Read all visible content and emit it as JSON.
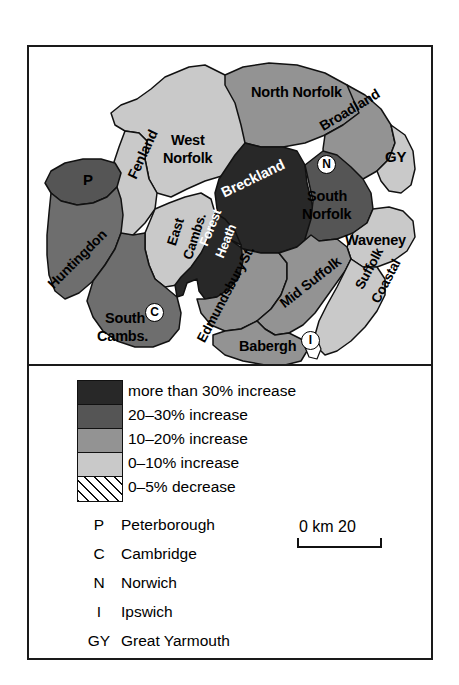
{
  "figure": {
    "type": "choropleth-map"
  },
  "map": {
    "regions": [
      {
        "id": "north-norfolk",
        "label": "North Norfolk",
        "class_index": 2
      },
      {
        "id": "broadland",
        "label": "Broadland",
        "class_index": 2
      },
      {
        "id": "great-yarmouth",
        "label": "GY",
        "class_index": 3
      },
      {
        "id": "west-norfolk",
        "label": "West\nNorfolk",
        "class_index": 3
      },
      {
        "id": "breckland",
        "label": "Breckland",
        "class_index": 0
      },
      {
        "id": "south-norfolk",
        "label": "South\nNorfolk",
        "class_index": 1
      },
      {
        "id": "waveney",
        "label": "Waveney",
        "class_index": 3
      },
      {
        "id": "fenland",
        "label": "Fenland",
        "class_index": 3
      },
      {
        "id": "peterborough",
        "label": "P",
        "class_index": 1
      },
      {
        "id": "huntingdon",
        "label": "Huntingdon",
        "class_index": 1
      },
      {
        "id": "east-cambs",
        "label": "East\nCambs.",
        "class_index": 3
      },
      {
        "id": "forest-heath",
        "label": "Forest\nHeath",
        "class_index": 0
      },
      {
        "id": "south-cambs",
        "label": "South\nCambs.",
        "class_index": 1
      },
      {
        "id": "st-edmundsbury",
        "label": "St.\nEdmundsbury",
        "class_index": 2
      },
      {
        "id": "mid-suffolk",
        "label": "Mid Suffolk",
        "class_index": 2
      },
      {
        "id": "suffolk-coastal",
        "label": "Suffolk\nCoastal",
        "class_index": 3
      },
      {
        "id": "babergh",
        "label": "Babergh",
        "class_index": 2
      }
    ],
    "city_markers": [
      {
        "id": "norwich-marker",
        "letter": "N"
      },
      {
        "id": "cambridge-marker",
        "letter": "C"
      },
      {
        "id": "ipswich-marker",
        "letter": "I"
      }
    ],
    "labels": {
      "north_norfolk": "North Norfolk",
      "broadland": "Broadland",
      "gy": "GY",
      "west_norfolk_l1": "West",
      "west_norfolk_l2": "Norfolk",
      "breckland": "Breckland",
      "south_norfolk_l1": "South",
      "south_norfolk_l2": "Norfolk",
      "waveney": "Waveney",
      "fenland": "Fenland",
      "peterborough_initial": "P",
      "huntingdon": "Huntingdon",
      "east_cambs_l1": "East",
      "east_cambs_l2": "Cambs.",
      "forest_heath_l1": "Forest",
      "forest_heath_l2": "Heath",
      "south_cambs_l1": "South",
      "south_cambs_l2": "Cambs.",
      "st_edmundsbury_l1": "St.",
      "st_edmundsbury_l2": "Edmundsbury",
      "mid_suffolk": "Mid Suffolk",
      "suffolk_coastal_l1": "Suffolk",
      "suffolk_coastal_l2": "Coastal",
      "babergh": "Babergh",
      "norwich_initial": "N",
      "cambridge_initial": "C",
      "ipswich_initial": "I"
    }
  },
  "legend": {
    "classes": [
      {
        "label": "more than 30% increase",
        "color": "#282828",
        "pattern": "solid"
      },
      {
        "label": "20–30% increase",
        "color": "#555555",
        "pattern": "solid"
      },
      {
        "label": "10–20% increase",
        "color": "#939393",
        "pattern": "solid"
      },
      {
        "label": "0–10% increase",
        "color": "#c9c9c9",
        "pattern": "solid"
      },
      {
        "label": "0–5% decrease",
        "color": "#ffffff",
        "pattern": "hatch"
      }
    ],
    "abbreviations": [
      {
        "key": "P",
        "name": "Peterborough"
      },
      {
        "key": "C",
        "name": "Cambridge"
      },
      {
        "key": "N",
        "name": "Norwich"
      },
      {
        "key": "I",
        "name": "Ipswich"
      },
      {
        "key": "GY",
        "name": "Great Yarmouth"
      }
    ],
    "scale": {
      "text": "0 km 20",
      "start": "0",
      "unit": "km",
      "end": "20"
    }
  }
}
